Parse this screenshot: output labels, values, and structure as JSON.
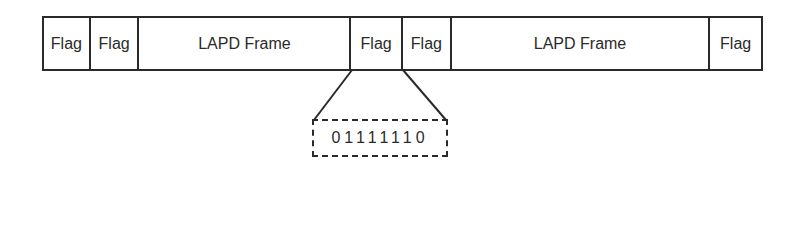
{
  "diagram": {
    "type": "LAPD frame sequence with flag delimiters",
    "cells": [
      {
        "label": "Flag",
        "width": 47
      },
      {
        "label": "Flag",
        "width": 49
      },
      {
        "label": "LAPD Frame",
        "width": 213
      },
      {
        "label": "Flag",
        "width": 52
      },
      {
        "label": "Flag",
        "width": 49
      },
      {
        "label": "LAPD Frame",
        "width": 260
      },
      {
        "label": "Flag",
        "width": 51
      }
    ],
    "expanded_cell_index": 3,
    "flag_bits": "01111110",
    "line_color": "#2a2a2a"
  }
}
